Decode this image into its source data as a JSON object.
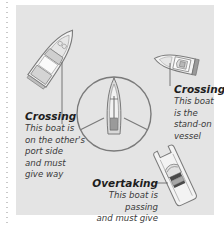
{
  "figure": {
    "colors": {
      "panel_bg": "#e4e4e4",
      "outline": "#7a7a7a",
      "hull_fill": "#f4f4f4",
      "deck_fill": "#d6d6d6",
      "text": "#2a2a2a"
    }
  },
  "annotations": {
    "crossing_left": {
      "title": "Crossing",
      "lines": [
        "This boat is",
        "on the other's",
        "port side",
        "and must",
        "give way"
      ]
    },
    "crossing_right": {
      "title": "Crossing",
      "lines": [
        "This boat",
        "is the",
        "stand-on",
        "vessel"
      ]
    },
    "overtaking": {
      "title": "Overtaking",
      "lines": [
        "This boat is passing",
        "and must give way"
      ]
    }
  },
  "icons": {
    "center": "sailboat-icon",
    "top_left": "motorboat-icon",
    "top_right": "motorboat-icon",
    "bottom_right": "catamaran-icon"
  }
}
